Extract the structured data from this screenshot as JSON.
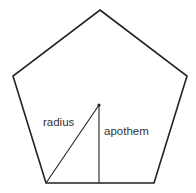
{
  "diagram": {
    "shape": "regular pentagon",
    "labels": {
      "radius": "radius",
      "apothem": "apothem"
    },
    "colors": {
      "stroke": "#222222",
      "text": "#333333",
      "background": "#ffffff"
    }
  }
}
